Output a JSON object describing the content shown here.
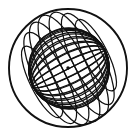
{
  "figure": {
    "title": "Wireframe sphere with meridian great circles",
    "kind": "line-diagram",
    "background_color": "#ffffff",
    "stroke_color": "#111111",
    "width": 138,
    "height": 138
  },
  "chart_data": {
    "type": "line",
    "title": "Wireframe sphere with meridian great circles",
    "subtitle": "",
    "xlabel": "",
    "ylabel": "",
    "grid": false,
    "legend_position": "none",
    "tick_labels": [],
    "annotations": [],
    "geometry": {
      "description": "Orthographic wireframe of a sphere. A family of great circles (meridians) all intersect at two antipodal poles. Each meridian projects to an ellipse whose major axis passes through both poles. The sphere silhouette is the outer circle.",
      "sphere_outline": {
        "center_x": 68,
        "center_y": 68,
        "radius": 59,
        "stroke_width": 1.9
      },
      "center_dot": {
        "center_x": 68,
        "center_y": 68,
        "radius": 1.7,
        "label": "center-marker"
      },
      "poles": [
        {
          "name": "pole-upper-right",
          "x": 105,
          "y": 50
        },
        {
          "name": "pole-lower-left",
          "x": 33,
          "y": 87
        }
      ],
      "pole_axis": {
        "tilt_degrees": -26.6,
        "half_length": 40.4,
        "midpoint_x": 69,
        "midpoint_y": 68.5
      },
      "meridian_count": 16,
      "meridian_half_widths": [
        0.0,
        7.4,
        14.6,
        21.4,
        27.6,
        33.0,
        37.4,
        40.0,
        40.4,
        38.6,
        34.8,
        29.4,
        22.8,
        15.4,
        7.8,
        0.0
      ],
      "meridian_stroke_width": 1.25,
      "outline_ellipse_extra": {
        "note": "Two near-limb meridians read as the heavy outer rim",
        "stroke_width": 1.9
      }
    }
  }
}
